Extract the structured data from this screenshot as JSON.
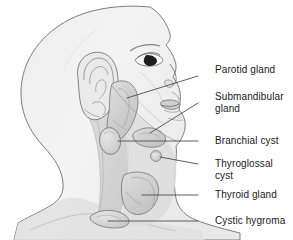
{
  "figure": {
    "view": "left lateral profile of a head and neck",
    "palette": {
      "background": "#ffffff",
      "skin_fill": "#f2f2f2",
      "skin_outline": "#6e6e6e",
      "muscle_shade": "#d9d9d9",
      "muscle_shade_dark": "#cfcfcf",
      "gland_fill": "#d2d2d2",
      "gland_outline": "#7a7a7a",
      "leader_line": "#4d4d4d",
      "text": "#1a1a1a",
      "eye_pupil": "#1c1c1c"
    }
  },
  "labels": [
    {
      "id": "parotid-gland",
      "text": "Parotid gland",
      "x": 215,
      "y": 70,
      "leader": {
        "x1": 198,
        "y1": 76,
        "x2": 127,
        "y2": 98
      }
    },
    {
      "id": "submandibular-gland",
      "text": "Submandibular\ngland",
      "x": 215,
      "y": 97,
      "leader": {
        "x1": 198,
        "y1": 103,
        "x2": 150,
        "y2": 133
      }
    },
    {
      "id": "branchial-cyst",
      "text": "Branchial cyst",
      "x": 215,
      "y": 136,
      "leader": {
        "x1": 198,
        "y1": 141,
        "x2": 118,
        "y2": 141
      }
    },
    {
      "id": "thyroglossal-cyst",
      "text": "Thyroglossal\ncyst",
      "x": 215,
      "y": 159,
      "leader": {
        "x1": 198,
        "y1": 164,
        "x2": 160,
        "y2": 157
      }
    },
    {
      "id": "thyroid-gland",
      "text": "Thyroid gland",
      "x": 215,
      "y": 190,
      "leader": {
        "x1": 198,
        "y1": 195,
        "x2": 142,
        "y2": 195
      }
    },
    {
      "id": "cystic-hygroma",
      "text": "Cystic hygroma",
      "x": 215,
      "y": 219,
      "leader": {
        "x1": 198,
        "y1": 221,
        "x2": 108,
        "y2": 221
      }
    }
  ],
  "structures": [
    {
      "id": "parotid-gland",
      "name": "Parotid gland"
    },
    {
      "id": "submandibular-gland",
      "name": "Submandibular gland"
    },
    {
      "id": "branchial-cyst",
      "name": "Branchial cyst"
    },
    {
      "id": "thyroglossal-cyst",
      "name": "Thyroglossal cyst"
    },
    {
      "id": "thyroid-gland",
      "name": "Thyroid gland"
    },
    {
      "id": "cystic-hygroma",
      "name": "Cystic hygroma"
    },
    {
      "id": "ear-auricle",
      "name": "Ear auricle"
    },
    {
      "id": "sternocleidomastoid",
      "name": "Sternocleidomastoid muscle"
    },
    {
      "id": "eye",
      "name": "Eye"
    },
    {
      "id": "nose",
      "name": "Nose"
    },
    {
      "id": "lips",
      "name": "Lips"
    }
  ]
}
